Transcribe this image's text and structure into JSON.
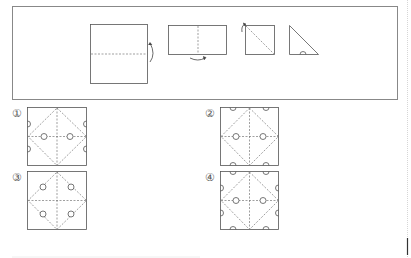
{
  "problem": {
    "frame": {
      "x": 12,
      "y": 6,
      "w": 385,
      "h": 93
    },
    "steps": [
      {
        "id": "step-1",
        "shape": "square",
        "desc": "fold bottom up along horizontal dashed line"
      },
      {
        "id": "step-2",
        "shape": "rectangle",
        "desc": "fold along vertical dashed line"
      },
      {
        "id": "step-3",
        "shape": "square",
        "desc": "fold along diagonal"
      },
      {
        "id": "step-4",
        "shape": "triangle",
        "desc": "semicircle cut on bottom edge"
      }
    ]
  },
  "options": [
    {
      "label": "①",
      "x": 27,
      "y": 107
    },
    {
      "label": "②",
      "x": 220,
      "y": 107
    },
    {
      "label": "③",
      "x": 27,
      "y": 171
    },
    {
      "label": "④",
      "x": 220,
      "y": 171
    }
  ],
  "colors": {
    "line": "#555555",
    "dash": "#777777",
    "frame": "#888888"
  }
}
